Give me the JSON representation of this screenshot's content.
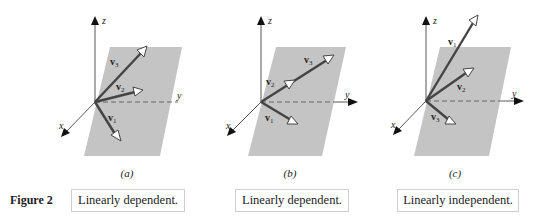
{
  "figure": {
    "label": "Figure 2",
    "panels": [
      {
        "id": "a",
        "caption": "(a)",
        "statement": "Linearly dependent.",
        "axes": {
          "x": "x",
          "y": "y",
          "z": "z"
        },
        "vectors": [
          {
            "name": "v",
            "sub": "1"
          },
          {
            "name": "v",
            "sub": "2"
          },
          {
            "name": "v",
            "sub": "3"
          }
        ]
      },
      {
        "id": "b",
        "caption": "(b)",
        "statement": "Linearly dependent.",
        "axes": {
          "x": "x",
          "y": "y",
          "z": "z"
        },
        "vectors": [
          {
            "name": "v",
            "sub": "1"
          },
          {
            "name": "v",
            "sub": "2"
          },
          {
            "name": "v",
            "sub": "3"
          }
        ]
      },
      {
        "id": "c",
        "caption": "(c)",
        "statement": "Linearly independent.",
        "axes": {
          "x": "x",
          "y": "y",
          "z": "z"
        },
        "vectors": [
          {
            "name": "v",
            "sub": "1"
          },
          {
            "name": "v",
            "sub": "2"
          },
          {
            "name": "v",
            "sub": "3"
          }
        ]
      }
    ]
  },
  "colors": {
    "plane": "#c4c4c4",
    "vector": "#444444",
    "axis": "#444444"
  }
}
